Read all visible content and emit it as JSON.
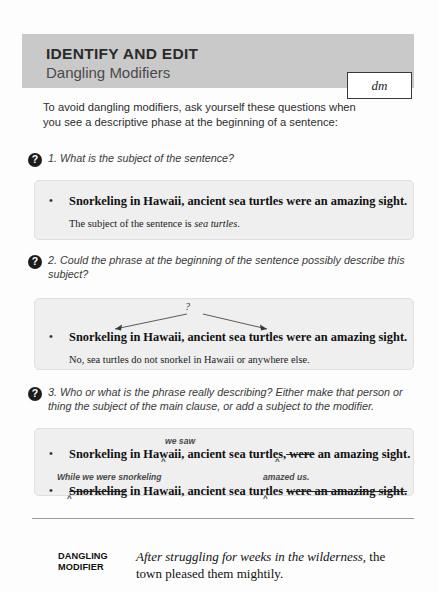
{
  "header": {
    "title": "IDENTIFY AND EDIT",
    "subtitle": "Dangling Modifiers",
    "tag": "dm",
    "band_color": "#c9c9c9"
  },
  "intro": "To avoid dangling modifiers, ask yourself these questions when you see a descriptive phase at the beginning of a sentence:",
  "questions": [
    {
      "number": "1.",
      "text": "1. What is the subject of the sentence?",
      "example": {
        "sentence": "Snorkeling in Hawaii, ancient sea turtles were an amazing sight.",
        "note_before": "The subject of the sentence is ",
        "note_italic": "sea turtles",
        "note_after": "."
      }
    },
    {
      "number": "2.",
      "text": "2. Could the phrase at the beginning of the sentence possibly describe this subject?",
      "annotation": "?",
      "example": {
        "sentence": "Snorkeling in Hawaii, ancient sea turtles were an amazing sight.",
        "note": "No, sea turtles do not snorkel in Hawaii or anywhere else."
      }
    },
    {
      "number": "3.",
      "text": "3. Who or what is the phrase really describing? Either make that person or thing the subject of the main clause, or add a subject to the modifier.",
      "edits": [
        {
          "insertion": "we saw",
          "part_a": "Snorkeling in Hawaii,",
          "part_b": " ancient sea turtles,",
          "struck": " were",
          "part_c": " an amazing sight."
        },
        {
          "insertion_left": "While we were snorkeling",
          "insertion_right": "amazed us.",
          "struck_start": "Snorkeling",
          "middle": " in Hawaii, ancient sea turtles ",
          "struck_end": "were an amazing sight."
        }
      ]
    }
  ],
  "footer": {
    "label_line1": "DANGLING",
    "label_line2": "MODIFIER",
    "italic_part": "After struggling for weeks in the wilderness,",
    "roman_part": " the town pleased them mightily."
  }
}
